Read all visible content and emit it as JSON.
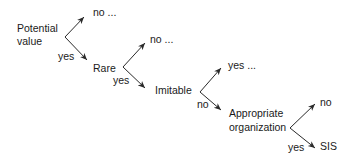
{
  "diagram": {
    "type": "decision-tree",
    "nodes": [
      {
        "id": "potential_value",
        "label_line1": "Potential",
        "label_line2": "value"
      },
      {
        "id": "rare",
        "label": "Rare"
      },
      {
        "id": "imitable",
        "label": "Imitable"
      },
      {
        "id": "appropriate_organization",
        "label_line1": "Appropriate",
        "label_line2": "organization"
      },
      {
        "id": "sis",
        "label": "SIS"
      }
    ],
    "edges": [
      {
        "from": "potential_value",
        "up_label": "no ...",
        "down_label": "yes",
        "down_to": "rare"
      },
      {
        "from": "rare",
        "up_label": "no ...",
        "down_label": "yes",
        "down_to": "imitable"
      },
      {
        "from": "imitable",
        "up_label": "yes ...",
        "down_label": "no",
        "down_to": "appropriate_organization"
      },
      {
        "from": "appropriate_organization",
        "up_label": "no",
        "down_label": "yes",
        "down_to": "sis"
      }
    ]
  },
  "colors": {
    "line": "#2a2a2a",
    "text": "#1a1a1a",
    "background": "#ffffff"
  }
}
